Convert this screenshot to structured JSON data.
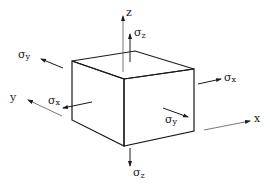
{
  "diagram": {
    "colors": {
      "line": "#1a1a1a",
      "axis": "#555555",
      "background": "#ffffff"
    },
    "axes": {
      "x": {
        "label": "x"
      },
      "y": {
        "label": "y"
      },
      "z": {
        "label": "z"
      }
    },
    "stresses": {
      "sigma_z_top": {
        "symbol": "σ",
        "sub": "z"
      },
      "sigma_z_bottom": {
        "symbol": "σ",
        "sub": "z"
      },
      "sigma_x_left": {
        "symbol": "σ",
        "sub": "x"
      },
      "sigma_x_right": {
        "symbol": "σ",
        "sub": "x"
      },
      "sigma_y_back": {
        "symbol": "σ",
        "sub": "y"
      },
      "sigma_y_front": {
        "symbol": "σ",
        "sub": "y"
      }
    }
  }
}
